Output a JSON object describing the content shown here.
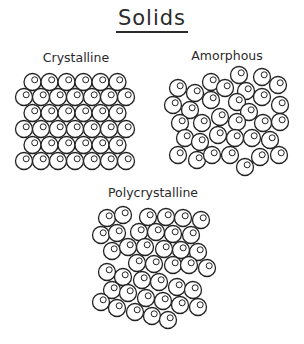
{
  "title": "Solids",
  "panels": [
    {
      "label": "Crystalline",
      "label_pos": [
        76,
        50
      ]
    },
    {
      "label": "Amorphous",
      "label_pos": [
        227,
        48
      ]
    },
    {
      "label": "Polycrystalline",
      "label_pos": [
        153,
        185
      ]
    }
  ],
  "colors": {
    "stroke": "#222222",
    "background": "#ffffff"
  },
  "atom": {
    "radius": 8.5,
    "inner_radius": 3,
    "inner_offset": [
      2.2,
      -2.2
    ]
  },
  "crystalline": {
    "rows": [
      {
        "y": 82,
        "x0": 32.5,
        "count": 6
      },
      {
        "y": 97,
        "x0": 24,
        "count": 7
      },
      {
        "y": 113,
        "x0": 32.5,
        "count": 6
      },
      {
        "y": 129,
        "x0": 24,
        "count": 7
      },
      {
        "y": 145,
        "x0": 32.5,
        "count": 6
      },
      {
        "y": 161,
        "x0": 24,
        "count": 7
      }
    ],
    "step": 17
  },
  "amorphous": [
    [
      239,
      75
    ],
    [
      262,
      77
    ],
    [
      211,
      82
    ],
    [
      278,
      85
    ],
    [
      178,
      88
    ],
    [
      225,
      88
    ],
    [
      246,
      91
    ],
    [
      195,
      93
    ],
    [
      262,
      97
    ],
    [
      211,
      100
    ],
    [
      237,
      102
    ],
    [
      173,
      105
    ],
    [
      280,
      105
    ],
    [
      190,
      110
    ],
    [
      249,
      112
    ],
    [
      220,
      117
    ],
    [
      180,
      123
    ],
    [
      202,
      123
    ],
    [
      237,
      122
    ],
    [
      263,
      123
    ],
    [
      280,
      122
    ],
    [
      185,
      138
    ],
    [
      218,
      135
    ],
    [
      200,
      142
    ],
    [
      235,
      138
    ],
    [
      252,
      138
    ],
    [
      270,
      140
    ],
    [
      178,
      155
    ],
    [
      197,
      160
    ],
    [
      212,
      155
    ],
    [
      230,
      155
    ],
    [
      260,
      157
    ],
    [
      279,
      155
    ],
    [
      245,
      167
    ]
  ],
  "polycrystalline": [
    [
      107,
      218
    ],
    [
      123,
      215
    ],
    [
      148,
      217
    ],
    [
      166,
      217
    ],
    [
      183,
      218
    ],
    [
      201,
      220
    ],
    [
      101,
      235
    ],
    [
      117,
      233
    ],
    [
      139,
      232
    ],
    [
      156,
      232
    ],
    [
      173,
      234
    ],
    [
      191,
      235
    ],
    [
      112,
      251
    ],
    [
      128,
      247
    ],
    [
      145,
      247
    ],
    [
      164,
      249
    ],
    [
      181,
      250
    ],
    [
      198,
      252
    ],
    [
      137,
      263
    ],
    [
      154,
      264
    ],
    [
      173,
      265
    ],
    [
      189,
      265
    ],
    [
      207,
      268
    ],
    [
      107,
      272
    ],
    [
      123,
      277
    ],
    [
      142,
      280
    ],
    [
      159,
      282
    ],
    [
      177,
      287
    ],
    [
      193,
      290
    ],
    [
      112,
      290
    ],
    [
      128,
      293
    ],
    [
      146,
      298
    ],
    [
      163,
      301
    ],
    [
      180,
      305
    ],
    [
      198,
      307
    ],
    [
      101,
      302
    ],
    [
      117,
      308
    ],
    [
      135,
      312
    ],
    [
      152,
      316
    ],
    [
      168,
      320
    ]
  ]
}
